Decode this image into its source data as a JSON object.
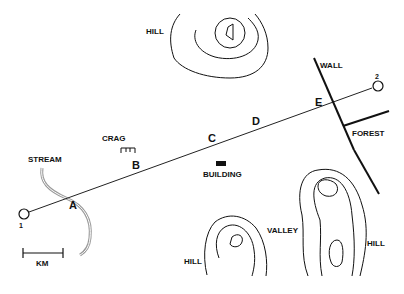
{
  "map": {
    "colors": {
      "ink": "#111111",
      "stream": "#9a9a9a",
      "background": "#ffffff"
    },
    "features": {
      "hill_north": "HILL",
      "crag": "CRAG",
      "stream": "STREAM",
      "building": "BUILDING",
      "wall": "WALL",
      "forest": "FOREST",
      "valley": "VALLEY",
      "hill_southwest": "HILL",
      "hill_southeast": "HILL"
    },
    "route": {
      "start_label": "1",
      "end_label": "2",
      "checkpoints": [
        "A",
        "B",
        "C",
        "D",
        "E"
      ]
    },
    "scale_bar": {
      "label": "KM"
    }
  }
}
